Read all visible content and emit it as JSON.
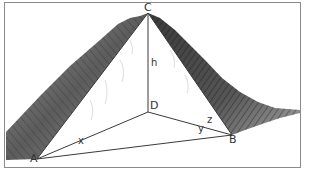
{
  "diagram": {
    "type": "geometry-mountain-tetrahedron",
    "points": {
      "C": {
        "label": "C",
        "x": 148,
        "y": 13
      },
      "D": {
        "label": "D",
        "x": 148,
        "y": 112
      },
      "A": {
        "label": "A",
        "x": 37,
        "y": 159
      },
      "B": {
        "label": "B",
        "x": 232,
        "y": 135
      }
    },
    "segments": [
      {
        "from": "C",
        "to": "D",
        "label": "h"
      },
      {
        "from": "D",
        "to": "A",
        "label": "x"
      },
      {
        "from": "D",
        "to": "B",
        "label": "y"
      },
      {
        "from": "C",
        "to": "B",
        "label": "z"
      },
      {
        "from": "C",
        "to": "A",
        "label": ""
      },
      {
        "from": "A",
        "to": "B",
        "label": ""
      }
    ],
    "labels": {
      "C": "C",
      "D": "D",
      "A": "A",
      "B": "B",
      "h": "h",
      "x": "x",
      "y": "y",
      "z": "z"
    },
    "colors": {
      "line": "#3a3a3a",
      "mountain_dark": "#2b2b2b",
      "mountain_mid": "#7a7a7a",
      "mountain_light": "#c8c8c8",
      "frame": "#8a8a8a"
    }
  }
}
